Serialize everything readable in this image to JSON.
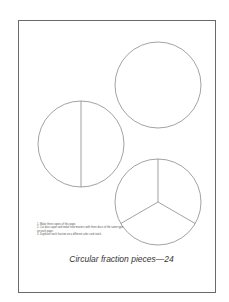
{
  "page": {
    "title": "Circular fraction pieces—24",
    "instructions": [
      "1. Make three copies of this page.",
      "2. Cut discs apart and make new masters with three discs of the same type on each page.",
      "3. Duplicate each fraction on a different color card stock."
    ]
  },
  "discs": [
    {
      "name": "whole",
      "pieces": 1,
      "cx": 158,
      "cy": 85,
      "r": 43
    },
    {
      "name": "halves",
      "pieces": 2,
      "cx": 81,
      "cy": 144,
      "r": 43
    },
    {
      "name": "thirds",
      "pieces": 3,
      "cx": 158,
      "cy": 202,
      "r": 43
    }
  ],
  "colors": {
    "line": "#7a7a7a",
    "frame": "#6a6a6a",
    "background": "#ffffff"
  }
}
